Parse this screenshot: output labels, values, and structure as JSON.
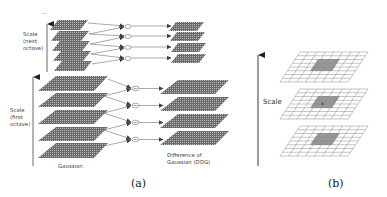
{
  "figure": {
    "panel_a": {
      "caption": "(a)",
      "ellipsis": "...",
      "next_octave_label": [
        "Scale",
        "(next",
        "octave)"
      ],
      "first_octave_label": [
        "Scale",
        "(first",
        "octave)"
      ],
      "gaussian_label": "Gaussian",
      "dog_label": [
        "Difference of",
        "Gaussian (DOG)"
      ],
      "next_octave": {
        "gaussian_planes": 5,
        "dog_planes": 4,
        "subtraction_nodes": 4
      },
      "first_octave": {
        "gaussian_planes": 5,
        "dog_planes": 4,
        "subtraction_nodes": 4
      },
      "subtraction_symbol": "−"
    },
    "panel_b": {
      "caption": "(b)",
      "scale_label": "Scale",
      "grid_layers": 3,
      "grid_size": "8x8",
      "highlighted_neighborhood": "3x3"
    },
    "colors": {
      "plane_fill": "#6f6f6f",
      "plane_mesh": "#bdbdbd",
      "line": "#555555",
      "grid_line": "#8a8a8a",
      "neighbor_fill": "#8c8c8c"
    }
  }
}
